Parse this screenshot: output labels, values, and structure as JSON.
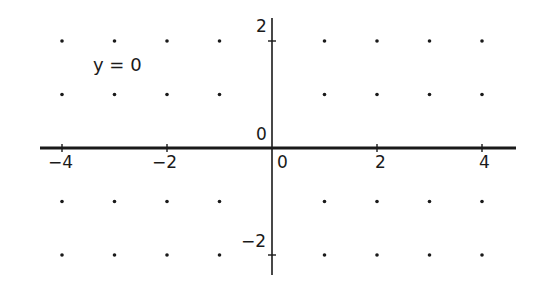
{
  "chart_data": {
    "type": "line",
    "title": "",
    "annotation": "y = 0",
    "xlabel": "",
    "ylabel": "",
    "xlim": [
      -4.5,
      4.5
    ],
    "ylim": [
      -2.4,
      2.2
    ],
    "x_ticks": [
      -4,
      -2,
      0,
      2,
      4
    ],
    "x_tick_labels": [
      "−4",
      "−2",
      "0",
      "2",
      "4"
    ],
    "y_ticks": [
      2,
      0,
      -2
    ],
    "y_tick_labels": [
      "2",
      "0",
      "−2"
    ],
    "grid": "dots",
    "grid_points_x": [
      -4,
      -3,
      -2,
      -1,
      1,
      2,
      3,
      4
    ],
    "grid_points_y": [
      2,
      1,
      -1,
      -2
    ],
    "series": [
      {
        "name": "y = 0",
        "x": [
          -4.5,
          4.5
        ],
        "y": [
          0,
          0
        ]
      }
    ]
  },
  "colors": {
    "axis": "#1a1a1a",
    "line": "#1a1a1a",
    "dots": "#1a1a1a",
    "background": "#ffffff"
  }
}
